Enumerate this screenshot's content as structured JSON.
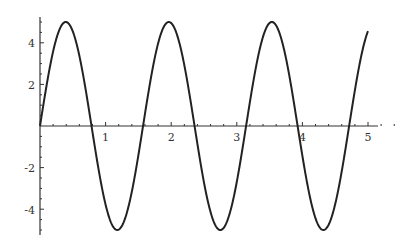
{
  "chart_data": {
    "type": "line",
    "title": "",
    "xlabel": "",
    "ylabel": "",
    "function": "5*sin(4*x)",
    "xlim": [
      0,
      5
    ],
    "ylim": [
      -5.2,
      5.2
    ],
    "grid": false,
    "legend": null,
    "x_ticks": [
      1,
      2,
      3,
      4,
      5
    ],
    "x_tick_labels": [
      "1",
      "2",
      "3",
      "4",
      "5"
    ],
    "y_ticks": [
      -4,
      -2,
      2,
      4
    ],
    "y_tick_labels": [
      "-4",
      "-2",
      "2",
      "4"
    ],
    "series": [
      {
        "name": "5 sin(4x)",
        "color": "#222222",
        "x": [
          0,
          0.393,
          0.785,
          1.178,
          1.571,
          1.963,
          2.356,
          2.749,
          3.142,
          3.534,
          3.927,
          4.32,
          4.712,
          5.0
        ],
        "y": [
          0,
          5,
          0,
          -5,
          0,
          5,
          0,
          -5,
          0,
          5,
          0,
          -5,
          0,
          4.56
        ]
      }
    ]
  },
  "axis": {
    "x_labels": [
      "1",
      "2",
      "3",
      "4",
      "5"
    ],
    "y_labels": [
      "4",
      "2",
      "-2",
      "-4"
    ]
  }
}
